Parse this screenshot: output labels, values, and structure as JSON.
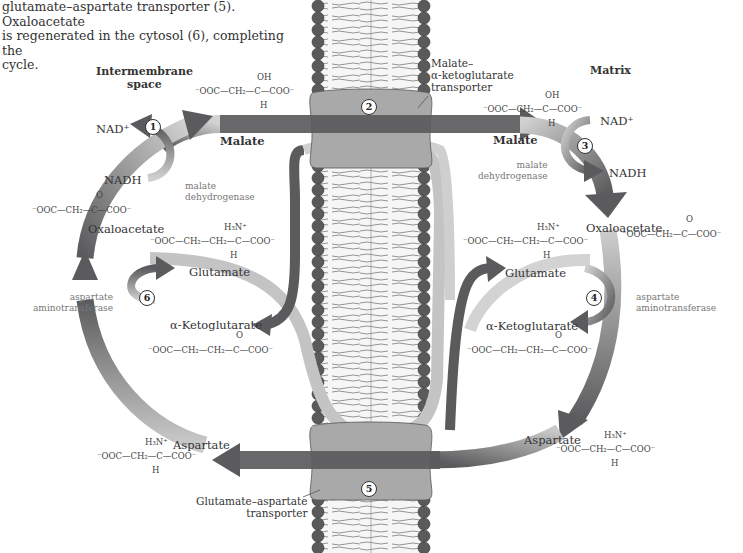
{
  "caption": {
    "line1": "glutamate–aspartate transporter (5). Oxaloacetate",
    "line2": "is regenerated in the cytosol (6), completing the",
    "line3": "cycle."
  },
  "compartments": {
    "left": "Intermembrane space",
    "left_line1": "Intermembrane",
    "left_line2": "space",
    "right": "Matrix"
  },
  "steps": [
    "1",
    "2",
    "3",
    "4",
    "5",
    "6"
  ],
  "transporters": {
    "top_line1": "Malate–",
    "top_line2": "α-ketoglutarate",
    "top_line3": "transporter",
    "bottom_line1": "Glutamate–aspartate",
    "bottom_line2": "transporter"
  },
  "enzymes": {
    "left_md_line1": "malate",
    "left_md_line2": "dehydrogenase",
    "right_md_line1": "malate",
    "right_md_line2": "dehydrogenase",
    "left_at_line1": "aspartate",
    "left_at_line2": "aminotransferase",
    "right_at_line1": "aspartate",
    "right_at_line2": "aminotransferase"
  },
  "cofactors": {
    "left_nad": "NAD⁺",
    "left_nadh": "NADH",
    "right_nad": "NAD⁺",
    "right_nadh": "NADH"
  },
  "molecules": {
    "left": {
      "malate": "Malate",
      "oxaloacetate": "Oxaloacetate",
      "glutamate": "Glutamate",
      "akg": "α-Ketoglutarate",
      "aspartate": "Aspartate"
    },
    "right": {
      "malate": "Malate",
      "oxaloacetate": "Oxaloacetate",
      "glutamate": "Glutamate",
      "akg": "α-Ketoglutarate",
      "aspartate": "Aspartate"
    }
  },
  "formulas": {
    "malate": {
      "top": "OH",
      "chain": "⁻OOC—CH₂—C—COO⁻",
      "bottom": "H"
    },
    "oxaloacetate": {
      "top": "O",
      "chain": "⁻OOC—CH₂—C—COO⁻"
    },
    "glutamate": {
      "top": "H₃N⁺",
      "chain": "⁻OOC—CH₂—CH₂—C—COO⁻",
      "bottom": "H"
    },
    "akg": {
      "top": "O",
      "chain": "⁻OOC—CH₂—CH₂—C—COO⁻"
    },
    "aspartate": {
      "top": "H₃N⁺",
      "chain": "⁻OOC—CH₂—C—COO⁻",
      "bottom": "H"
    }
  },
  "colors": {
    "arrow_dark": "#58595b",
    "arrow_light": "#c8c8c8",
    "membrane_head": "#5a5a5a",
    "membrane_core": "#f4f4f4",
    "transporter": "#a9a9a9"
  }
}
